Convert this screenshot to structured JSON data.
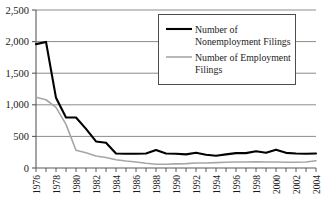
{
  "chart_data": {
    "type": "line",
    "title": "",
    "xlabel": "",
    "ylabel": "",
    "grid": true,
    "legend_position": "top-right",
    "xlim": [
      1976,
      2004
    ],
    "ylim": [
      0,
      2500
    ],
    "ytick_labels": [
      "0",
      "500",
      "1,000",
      "1,500",
      "2,000",
      "2,500"
    ],
    "ytick_values": [
      0,
      500,
      1000,
      1500,
      2000,
      2500
    ],
    "xtick_labels": [
      "1976",
      "1978",
      "1980",
      "1982",
      "1984",
      "1986",
      "1988",
      "1990",
      "1992",
      "1994",
      "1996",
      "1998",
      "2000",
      "2002",
      "2004"
    ],
    "xtick_values": [
      1976,
      1978,
      1980,
      1982,
      1984,
      1986,
      1988,
      1990,
      1992,
      1994,
      1996,
      1998,
      2000,
      2002,
      2004
    ],
    "x": [
      1976,
      1977,
      1978,
      1979,
      1980,
      1981,
      1982,
      1983,
      1984,
      1985,
      1986,
      1987,
      1988,
      1989,
      1990,
      1991,
      1992,
      1993,
      1994,
      1995,
      1996,
      1997,
      1998,
      1999,
      2000,
      2001,
      2002,
      2003,
      2004
    ],
    "series": [
      {
        "name": "Number of Nonemployment Filings",
        "color": "#000000",
        "width": 2.1,
        "values": [
          1960,
          1995,
          1110,
          800,
          800,
          620,
          420,
          400,
          230,
          225,
          225,
          230,
          285,
          230,
          225,
          215,
          240,
          210,
          195,
          215,
          235,
          235,
          265,
          240,
          290,
          240,
          230,
          225,
          230
        ]
      },
      {
        "name": "Number of Employment Filings",
        "color": "#a6a6a6",
        "width": 1.6,
        "values": [
          1120,
          1080,
          960,
          690,
          280,
          240,
          190,
          165,
          130,
          110,
          95,
          75,
          60,
          60,
          65,
          70,
          80,
          80,
          85,
          90,
          95,
          95,
          100,
          95,
          95,
          90,
          90,
          95,
          115
        ]
      }
    ]
  },
  "legend": {
    "entries": [
      {
        "label_line1": "Number of",
        "label_line2": "Nonemployment Filings",
        "color": "#000000",
        "width": 2.1
      },
      {
        "label_line1": "Number of Employment",
        "label_line2": "Filings",
        "color": "#a6a6a6",
        "width": 1.6
      }
    ]
  },
  "axis": {
    "y_ticks": [
      {
        "label": "2,500"
      },
      {
        "label": "2,000"
      },
      {
        "label": "1,500"
      },
      {
        "label": "1,000"
      },
      {
        "label": "500"
      },
      {
        "label": "0"
      }
    ],
    "x_ticks": [
      {
        "label": "1976"
      },
      {
        "label": "1978"
      },
      {
        "label": "1980"
      },
      {
        "label": "1982"
      },
      {
        "label": "1984"
      },
      {
        "label": "1986"
      },
      {
        "label": "1988"
      },
      {
        "label": "1990"
      },
      {
        "label": "1992"
      },
      {
        "label": "1994"
      },
      {
        "label": "1996"
      },
      {
        "label": "1998"
      },
      {
        "label": "2000"
      },
      {
        "label": "2002"
      },
      {
        "label": "2004"
      }
    ]
  },
  "colors": {
    "series_primary": "#000000",
    "series_secondary": "#a6a6a6",
    "gridline": "#8c8c8c",
    "axis": "#595959",
    "background": "#ffffff"
  }
}
